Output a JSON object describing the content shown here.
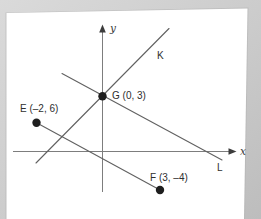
{
  "figure": {
    "x_axis_label": "x",
    "y_axis_label": "y",
    "line_k_label": "K",
    "line_l_label": "L",
    "point_g_label": "G (0, 3)",
    "point_e_label": "E (–2, 6)",
    "point_f_label": "F (3, –4)",
    "points": [
      {
        "name": "E",
        "coordinates": "(–2, 6)"
      },
      {
        "name": "G",
        "coordinates": "(0, 3)"
      },
      {
        "name": "F",
        "coordinates": "(3, –4)"
      }
    ],
    "colors": {
      "scan_background_light": "#d9d9d9",
      "scan_background_dark": "#bfbfbf",
      "page": "#ffffff",
      "page_edge_shadow": "#b2b2b2",
      "axis": "#7d7d7d",
      "line": "#616161",
      "point": "#1e1e1e",
      "label_text": "#2e2e2e"
    }
  }
}
